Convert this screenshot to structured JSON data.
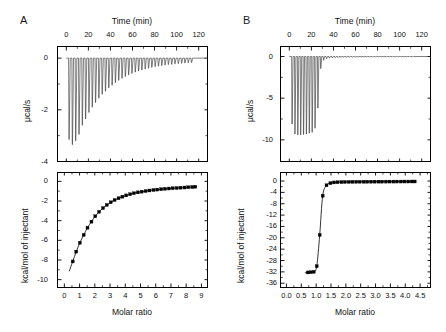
{
  "figure": {
    "panels": [
      {
        "letter": "A",
        "thermogram": {
          "top_axis_title": "Time (min)",
          "y_axis_title": "μcal/s",
          "xlim": [
            -8,
            128
          ],
          "ylim": [
            -4.0,
            0.45
          ],
          "xticks": [
            0,
            20,
            40,
            60,
            80,
            100,
            120
          ],
          "xticklabels": [
            "0",
            "20",
            "40",
            "60",
            "80",
            "100",
            "120"
          ],
          "xminor_step": 10,
          "yticks": [
            0,
            -2,
            -4
          ],
          "yticklabels": [
            "0",
            "-2",
            "-4"
          ],
          "yminor": [
            -1,
            -3
          ],
          "baseline": 0.0,
          "injection_start_min": 2.5,
          "injection_interval_min": 3.0,
          "peak_width_min": 1.5,
          "peak_depths_ucal_s": [
            -3.15,
            -3.35,
            -3.2,
            -2.95,
            -2.6,
            -2.35,
            -2.1,
            -1.9,
            -1.72,
            -1.55,
            -1.4,
            -1.28,
            -1.15,
            -1.05,
            -0.95,
            -0.86,
            -0.78,
            -0.71,
            -0.65,
            -0.59,
            -0.54,
            -0.5,
            -0.46,
            -0.42,
            -0.39,
            -0.36,
            -0.33,
            -0.31,
            -0.29,
            -0.27,
            -0.25,
            -0.24,
            -0.22,
            -0.21,
            -0.2,
            -0.19,
            -0.18,
            -0.17
          ]
        },
        "isotherm": {
          "bottom_axis_title": "Molar ratio",
          "y_axis_title": "kcal/mol of injectant",
          "xlim": [
            -0.45,
            9.4
          ],
          "ylim": [
            -10.8,
            0.9
          ],
          "xticks": [
            0,
            1,
            2,
            3,
            4,
            5,
            6,
            7,
            8,
            9
          ],
          "xticklabels": [
            "0",
            "1",
            "2",
            "3",
            "4",
            "5",
            "6",
            "7",
            "8",
            "9"
          ],
          "xminor_step": 0.5,
          "yticks": [
            0,
            -2,
            -4,
            -6,
            -8,
            -10
          ],
          "yticklabels": [
            "0",
            "-2",
            "-4",
            "-6",
            "-8",
            "-10"
          ],
          "yminor": [
            -1,
            -3,
            -5,
            -7,
            -9
          ],
          "points_x": [
            0.55,
            0.78,
            1.02,
            1.27,
            1.52,
            1.78,
            2.03,
            2.28,
            2.54,
            2.79,
            3.05,
            3.3,
            3.56,
            3.81,
            4.06,
            4.32,
            4.57,
            4.83,
            5.08,
            5.34,
            5.59,
            5.85,
            6.1,
            6.36,
            6.61,
            6.87,
            7.12,
            7.38,
            7.63,
            7.89,
            8.14,
            8.4,
            8.6
          ],
          "points_y": [
            -8.15,
            -7.15,
            -6.25,
            -5.45,
            -4.72,
            -4.1,
            -3.55,
            -3.1,
            -2.72,
            -2.4,
            -2.13,
            -1.9,
            -1.72,
            -1.56,
            -1.43,
            -1.31,
            -1.21,
            -1.12,
            -1.05,
            -0.99,
            -0.93,
            -0.88,
            -0.84,
            -0.8,
            -0.76,
            -0.73,
            -0.7,
            -0.68,
            -0.65,
            -0.63,
            -0.6,
            -0.58,
            -0.55
          ],
          "fit_description": "hyperbolic saturation curve, weak binding"
        }
      },
      {
        "letter": "B",
        "thermogram": {
          "top_axis_title": "Time (min)",
          "y_axis_title": "μcal/s",
          "xlim": [
            -8,
            128
          ],
          "ylim": [
            -12.6,
            1.2
          ],
          "xticks": [
            0,
            20,
            40,
            60,
            80,
            100,
            120
          ],
          "xticklabels": [
            "0",
            "20",
            "40",
            "60",
            "80",
            "100",
            "120"
          ],
          "xminor_step": 10,
          "yticks": [
            0,
            -5,
            -10
          ],
          "yticklabels": [
            "0",
            "-5",
            "-10"
          ],
          "yminor": [
            -2.5,
            -7.5
          ],
          "baseline": 0.0,
          "injection_start_min": 2.5,
          "injection_interval_min": 2.6,
          "peak_width_min": 1.3,
          "peak_depths_ucal_s": [
            -8.1,
            -9.3,
            -9.4,
            -9.4,
            -9.35,
            -9.3,
            -9.2,
            -9.1,
            -8.6,
            -6.2,
            -1.45,
            -0.45,
            -0.28,
            -0.2,
            -0.16,
            -0.14,
            -0.12,
            -0.11,
            -0.1,
            -0.1,
            -0.09,
            -0.09,
            -0.08,
            -0.08,
            -0.08,
            -0.07,
            -0.07,
            -0.07,
            -0.06,
            -0.06,
            -0.06,
            -0.06,
            -0.05,
            -0.05,
            -0.05,
            -0.05,
            -0.05,
            -0.05,
            -0.05,
            -0.05,
            -0.05,
            -0.05,
            -0.05
          ]
        },
        "isotherm": {
          "bottom_axis_title": "Molar ratio",
          "y_axis_title": "kcal/mol of injectant",
          "xlim": [
            -0.2,
            4.85
          ],
          "ylim": [
            -37.5,
            3.0
          ],
          "xticks": [
            0.0,
            0.5,
            1.0,
            1.5,
            2.0,
            2.5,
            3.0,
            3.5,
            4.0,
            4.5
          ],
          "xticklabels": [
            "0.0",
            "0.5",
            "1.0",
            "1.5",
            "2.0",
            "2.5",
            "3.0",
            "3.5",
            "4.0",
            "4.5"
          ],
          "xminor_step": 0.25,
          "yticks": [
            0,
            -4,
            -8,
            -12,
            -16,
            -20,
            -24,
            -28,
            -32,
            -36
          ],
          "yticklabels": [
            "0",
            "-4",
            "-8",
            "-12",
            "-16",
            "-20",
            "-24",
            "-28",
            "-32",
            "-36"
          ],
          "yminor": [
            -2,
            -6,
            -10,
            -14,
            -18,
            -22,
            -26,
            -30,
            -34
          ],
          "points_x": [
            0.72,
            0.82,
            0.92,
            1.02,
            1.12,
            1.22,
            1.35,
            1.48,
            1.6,
            1.72,
            1.85,
            1.97,
            2.1,
            2.22,
            2.35,
            2.47,
            2.6,
            2.72,
            2.85,
            2.97,
            3.1,
            3.22,
            3.35,
            3.47,
            3.6,
            3.72,
            3.85,
            3.97,
            4.1,
            4.22,
            4.32
          ],
          "points_y": [
            -32.2,
            -32.1,
            -32.0,
            -30.0,
            -19.0,
            -5.2,
            -1.5,
            -0.75,
            -0.5,
            -0.42,
            -0.38,
            -0.34,
            -0.32,
            -0.3,
            -0.28,
            -0.27,
            -0.26,
            -0.25,
            -0.24,
            -0.23,
            -0.22,
            -0.22,
            -0.21,
            -0.2,
            -0.2,
            -0.19,
            -0.19,
            -0.18,
            -0.18,
            -0.17,
            -0.17
          ],
          "plateau_low_y": -32.6,
          "fit_description": "sharp sigmoidal transition, tight binding, n ~ 1.2"
        }
      }
    ]
  }
}
